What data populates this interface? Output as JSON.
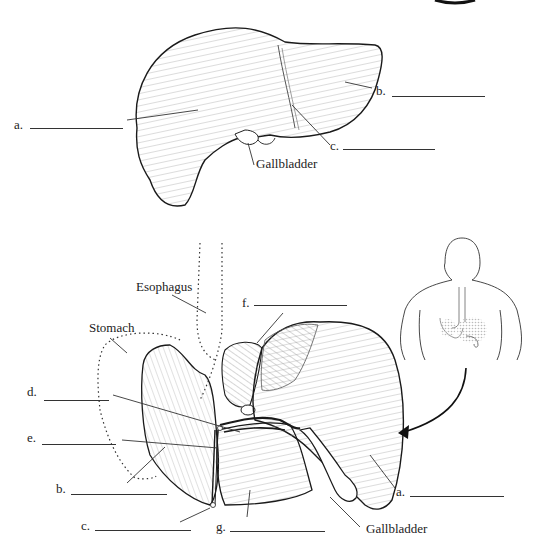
{
  "diagram": {
    "top_view": {
      "description": "Anterior view of liver",
      "labels": [
        {
          "id": "a",
          "text": "a.",
          "blank": true
        },
        {
          "id": "b",
          "text": "b.",
          "blank": true
        },
        {
          "id": "c",
          "text": "c.",
          "blank": true
        },
        {
          "id": "gallbladder",
          "text": "Gallbladder",
          "blank": false
        }
      ]
    },
    "bottom_view": {
      "description": "Posterior/visceral view of liver with stomach and esophagus outlined",
      "labels": [
        {
          "id": "esophagus",
          "text": "Esophagus",
          "blank": false
        },
        {
          "id": "stomach",
          "text": "Stomach",
          "blank": false
        },
        {
          "id": "f",
          "text": "f.",
          "blank": true
        },
        {
          "id": "d",
          "text": "d.",
          "blank": true
        },
        {
          "id": "e",
          "text": "e.",
          "blank": true
        },
        {
          "id": "b",
          "text": "b.",
          "blank": true
        },
        {
          "id": "c",
          "text": "c.",
          "blank": true
        },
        {
          "id": "g",
          "text": "g.",
          "blank": true
        },
        {
          "id": "a",
          "text": "a.",
          "blank": true
        },
        {
          "id": "gallbladder",
          "text": "Gallbladder",
          "blank": false
        }
      ]
    },
    "inset": {
      "description": "Human torso from behind showing stomach and liver location, arrow pointing to enlarged view"
    }
  },
  "colors": {
    "ink": "#1a1a1a",
    "hatch": "#8a8a8a",
    "inset_organ": "#c8c8c8"
  }
}
